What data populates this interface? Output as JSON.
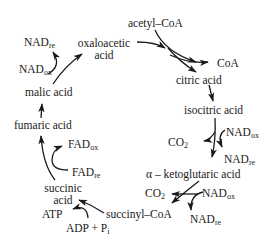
{
  "diagram": {
    "nodes": {
      "acetyl_coa": "acetyl–CoA",
      "coa": "CoA",
      "citric_acid": "citric acid",
      "isocitric_acid": "isocitric acid",
      "alpha_ketoglutaric_acid": "α – ketoglutaric acid",
      "succinyl_coa": "succinyl–CoA",
      "succinic_acid_line1": "succinic",
      "succinic_acid_line2": "acid",
      "fumaric_acid": "fumaric acid",
      "malic_acid": "malic acid",
      "oxaloacetic_acid_line1": "oxaloacetic",
      "oxaloacetic_acid_line2": "acid"
    },
    "cofactors": {
      "nad_base": "NAD",
      "fad_base": "FAD",
      "ox_sub": "ox",
      "re_sub": "re",
      "co2_base": "CO",
      "co2_sub": "2",
      "atp": "ATP",
      "adp_pi_base": "ADP + P",
      "adp_pi_sub": "i"
    },
    "colors": {
      "ink": "#1a1a1a",
      "background": "#ffffff"
    }
  }
}
